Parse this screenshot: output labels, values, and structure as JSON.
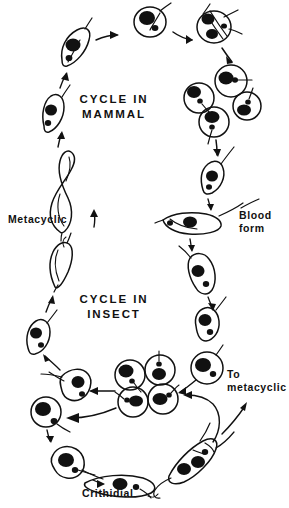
{
  "figure": {
    "kind": "line-drawing-diagram",
    "background_color": "#ffffff",
    "ink_color": "#111111",
    "width_px": 289,
    "height_px": 508
  },
  "titles": {
    "mammal_cycle": "CYCLE IN\nMAMMAL",
    "insect_cycle": "CYCLE IN\nINSECT"
  },
  "labels": {
    "metacyclic": "Metacyclic",
    "blood_form": "Blood\nform",
    "to_metacyclic": "To\nmetacyclic",
    "crithidial": "Crithidial"
  }
}
